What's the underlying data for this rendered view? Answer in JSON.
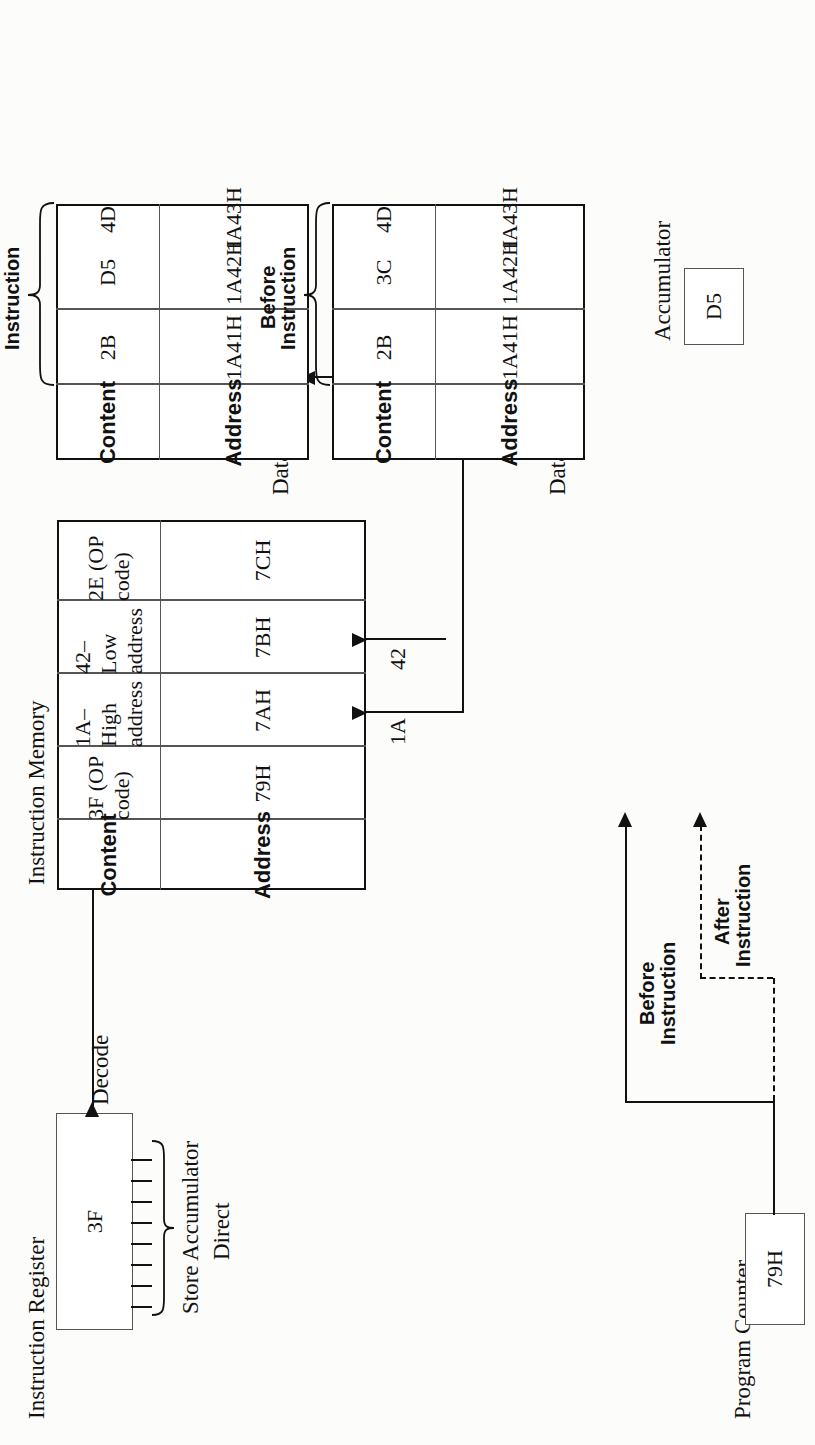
{
  "figure": {
    "orientation_deg": -90
  },
  "instruction_register": {
    "title": "Instruction Register",
    "value": "3F",
    "decode_label": "Decode",
    "decoded_line1": "Store Accumulator",
    "decoded_line2": "Direct",
    "bit_count": 8
  },
  "program_counter": {
    "title": "Program Counter",
    "value": "79H"
  },
  "instruction_memory": {
    "title": "Instruction Memory",
    "columns": [
      "Address",
      "Content"
    ],
    "rows": [
      {
        "address": "79H",
        "content": "3F (OP code)"
      },
      {
        "address": "7AH",
        "content": "1A–High address"
      },
      {
        "address": "7BH",
        "content": "42–Low address"
      },
      {
        "address": "7CH",
        "content": "2E (OP code)"
      }
    ],
    "pointer_before": {
      "line1": "Before",
      "line2": "Instruction",
      "target_row": "79H"
    },
    "pointer_after": {
      "line1": "After",
      "line2": "Instruction",
      "target_row": "7CH"
    }
  },
  "bus_labels": {
    "high_address": "1A",
    "low_address": "42"
  },
  "accumulator_after": {
    "title": "Accumulator",
    "value": "D5"
  },
  "accumulator_before": {
    "title": "Accumulator",
    "value": "D5"
  },
  "data_memory_after": {
    "title": "Data Memory",
    "state_label_line1": "After",
    "state_label_line2": "Instruction",
    "columns": [
      "Address",
      "Content"
    ],
    "rows": [
      {
        "address": "1A41H",
        "content": "2B"
      },
      {
        "address": "1A42H",
        "content": "D5"
      },
      {
        "address": "1A43H",
        "content": "4D"
      }
    ]
  },
  "data_memory_before": {
    "title": "Data Memory",
    "state_label_line1": "Before",
    "state_label_line2": "Instruction",
    "columns": [
      "Address",
      "Content"
    ],
    "rows": [
      {
        "address": "1A41H",
        "content": "2B"
      },
      {
        "address": "1A42H",
        "content": "3C"
      },
      {
        "address": "1A43H",
        "content": "4D"
      }
    ]
  },
  "colors": {
    "ink": "#111111",
    "paper": "#fcfcfa",
    "rule_light": "#555555"
  }
}
